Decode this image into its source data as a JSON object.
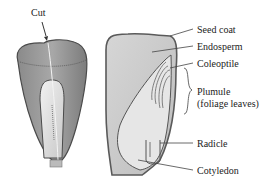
{
  "diagram": {
    "left_figure": {
      "label": "Cut"
    },
    "right_figure": {
      "labels": [
        {
          "id": "seed-coat",
          "text": "Seed coat"
        },
        {
          "id": "endosperm",
          "text": "Endosperm"
        },
        {
          "id": "coleoptile",
          "text": "Coleoptile"
        },
        {
          "id": "plumule",
          "text": "Plumule"
        },
        {
          "id": "plumule-sub",
          "text": "(foliage leaves)"
        },
        {
          "id": "radicle",
          "text": "Radicle"
        },
        {
          "id": "cotyledon",
          "text": "Cotyledon"
        }
      ]
    },
    "colors": {
      "seed_coat": "#6b6b6b",
      "endosperm": "#c9c9c9",
      "embryo": "#e4e4e4",
      "outline": "#4a4a4a",
      "text": "#222222"
    }
  }
}
